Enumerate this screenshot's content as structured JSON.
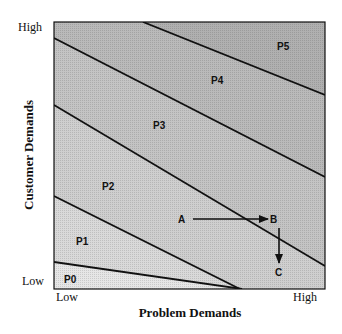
{
  "diagram": {
    "x_axis": {
      "title": "Problem Demands",
      "low": "Low",
      "high": "High"
    },
    "y_axis": {
      "title": "Customer Demands",
      "low": "Low",
      "high": "High"
    },
    "regions": [
      {
        "label": "P0",
        "fill": "#e6e6e6"
      },
      {
        "label": "P1",
        "fill": "#d9d9d9"
      },
      {
        "label": "P2",
        "fill": "#cfcfcf"
      },
      {
        "label": "P3",
        "fill": "#c4c4c4"
      },
      {
        "label": "P4",
        "fill": "#bababa"
      },
      {
        "label": "P5",
        "fill": "#b0b0b0"
      }
    ],
    "points": {
      "a": "A",
      "b": "B",
      "c": "C"
    },
    "line_color": "#111111"
  }
}
